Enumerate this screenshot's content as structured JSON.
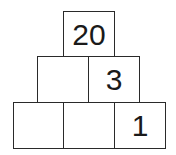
{
  "pyramid": {
    "rows": [
      {
        "row": 1,
        "cells": [
          {
            "value": "20"
          }
        ]
      },
      {
        "row": 2,
        "cells": [
          {
            "value": ""
          },
          {
            "value": "3"
          }
        ]
      },
      {
        "row": 3,
        "cells": [
          {
            "value": ""
          },
          {
            "value": ""
          },
          {
            "value": "1"
          }
        ]
      }
    ]
  }
}
